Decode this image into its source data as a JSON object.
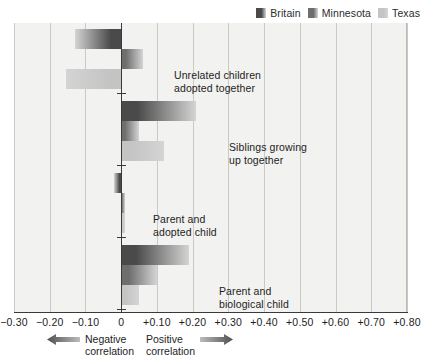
{
  "legend": {
    "entries": [
      {
        "label": "Britain",
        "color": "#4a4a4a",
        "name": "legend-swatch-britain"
      },
      {
        "label": "Minnesota",
        "color": "#6e6e6e",
        "name": "legend-swatch-minnesota"
      },
      {
        "label": "Texas",
        "color": "#c4c4c4",
        "name": "legend-swatch-texas"
      }
    ]
  },
  "axis": {
    "tick_labels": [
      "−0.30",
      "−0.20",
      "−0.10",
      "0",
      "+0.10",
      "+0.20",
      "+0.30",
      "+0.40",
      "+0.50",
      "+0.60",
      "+0.70",
      "+0.80"
    ]
  },
  "footer": {
    "negative": "Negative\ncorrelation",
    "positive": "Positive\ncorrelation"
  },
  "categories": [
    {
      "label": "Unrelated children\nadopted together"
    },
    {
      "label": "Siblings growing\nup together"
    },
    {
      "label": "Parent and\nadopted child"
    },
    {
      "label": "Parent and\nbiological child"
    }
  ],
  "chart_data": {
    "type": "bar",
    "orientation": "horizontal",
    "title": "",
    "xlabel": "Correlation",
    "ylabel": "",
    "xlim": [
      -0.3,
      0.8
    ],
    "xticks": [
      -0.3,
      -0.2,
      -0.1,
      0,
      0.1,
      0.2,
      0.3,
      0.4,
      0.5,
      0.6,
      0.7,
      0.8
    ],
    "grid": true,
    "legend_position": "top-right",
    "categories": [
      "Unrelated children adopted together",
      "Siblings growing up together",
      "Parent and adopted child",
      "Parent and biological child"
    ],
    "series": [
      {
        "name": "Britain",
        "color": "#4a4a4a",
        "values": [
          -0.13,
          0.21,
          -0.02,
          0.19
        ]
      },
      {
        "name": "Minnesota",
        "color": "#6e6e6e",
        "values": [
          0.06,
          0.05,
          0.01,
          0.1
        ]
      },
      {
        "name": "Texas",
        "color": "#c4c4c4",
        "values": [
          -0.155,
          0.12,
          0.01,
          0.05
        ]
      }
    ]
  }
}
